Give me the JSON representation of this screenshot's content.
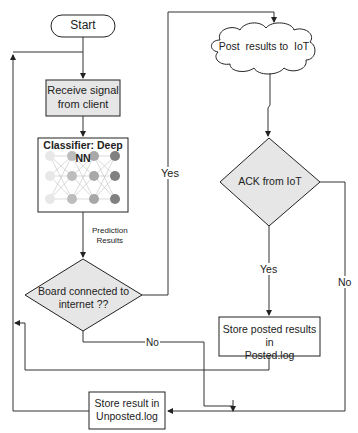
{
  "nodes": {
    "start": {
      "label": "Start"
    },
    "receive": {
      "line1": "Receive signal",
      "line2": "from client"
    },
    "classifier": {
      "title": "Classifier: Deep NN"
    },
    "board": {
      "line1": "Board connected to",
      "line2": "internet ??"
    },
    "post": {
      "label": "Post  results to  IoT"
    },
    "ack": {
      "label": "ACK from IoT"
    },
    "posted": {
      "line1": "Store posted results in",
      "line2": "Posted.log"
    },
    "unposted": {
      "line1": "Store result in",
      "line2": "Unposted.log"
    }
  },
  "edges": {
    "prediction": {
      "line1": "Prediction",
      "line2": "Results"
    },
    "board_yes": "Yes",
    "board_no": "No",
    "ack_yes": "Yes",
    "ack_no": "No"
  },
  "colors": {
    "box_fill": "#e6e6e6",
    "diamond_fill": "#e6e6e6",
    "stroke": "#222222",
    "nn_layer1": "#e8e8e8",
    "nn_layer2": "#bdbdbd",
    "nn_layer3": "#a8a8a8",
    "nn_layer4": "#808080"
  }
}
